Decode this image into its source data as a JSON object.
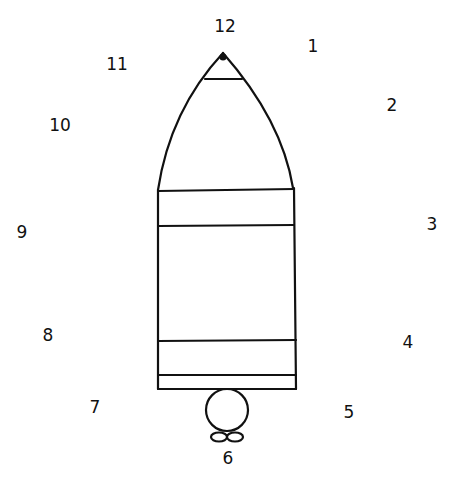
{
  "figure": {
    "stroke_color": "#111111",
    "background": "#ffffff"
  },
  "numbers": [
    {
      "label": "12",
      "x": 225,
      "y": 26
    },
    {
      "label": "1",
      "x": 313,
      "y": 46
    },
    {
      "label": "2",
      "x": 392,
      "y": 105
    },
    {
      "label": "3",
      "x": 432,
      "y": 224
    },
    {
      "label": "4",
      "x": 408,
      "y": 342
    },
    {
      "label": "5",
      "x": 349,
      "y": 412
    },
    {
      "label": "6",
      "x": 228,
      "y": 458
    },
    {
      "label": "7",
      "x": 95,
      "y": 407
    },
    {
      "label": "8",
      "x": 48,
      "y": 335
    },
    {
      "label": "9",
      "x": 22,
      "y": 232
    },
    {
      "label": "10",
      "x": 60,
      "y": 125
    },
    {
      "label": "11",
      "x": 117,
      "y": 64
    }
  ]
}
